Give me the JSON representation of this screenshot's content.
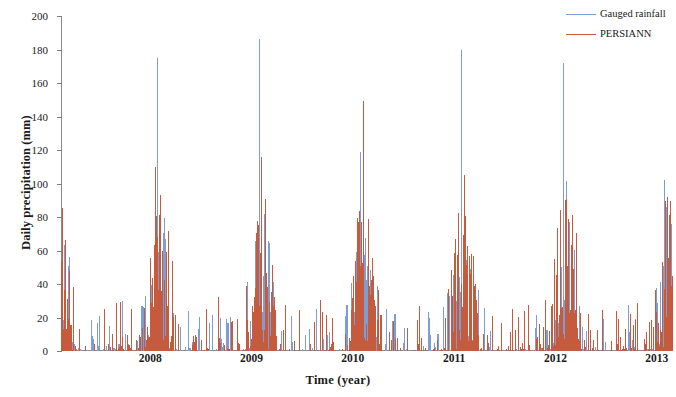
{
  "chart_data": {
    "type": "line",
    "title": "",
    "xlabel": "Time (year)",
    "ylabel": "Daily precipitation (mm)",
    "ylim": [
      0,
      200
    ],
    "yticks": [
      0,
      20,
      40,
      60,
      80,
      100,
      120,
      140,
      160,
      180,
      200
    ],
    "xticks": [
      "2008",
      "2009",
      "2010",
      "2011",
      "2012",
      "2013"
    ],
    "xlim": [
      "2007-08",
      "2013-08"
    ],
    "grid": false,
    "legend_position": "top-right",
    "series": [
      {
        "name": "Gauged rainfall",
        "color": "#7d9ed4",
        "peak_values_by_year": [
          175,
          186,
          119,
          180,
          172,
          102
        ],
        "notes": "Daily gauged station rainfall; strong monsoon peaks each summer, near-zero dry season."
      },
      {
        "name": "PERSIANN",
        "color": "#c65a3c",
        "peak_values_by_year": [
          93,
          116,
          149,
          105,
          90,
          92
        ],
        "notes": "PERSIANN satellite precipitation estimate; denser low-magnitude daily values, peak 149 mm in 2010."
      }
    ],
    "annotations": [
      {
        "label": "max gauged peak",
        "value": 186,
        "year": "2009"
      },
      {
        "label": "max PERSIANN peak",
        "value": 149,
        "year": "2010"
      }
    ]
  },
  "legend": {
    "items": [
      {
        "label": "Gauged rainfall",
        "color": "#7d9ed4"
      },
      {
        "label": "PERSIANN",
        "color": "#c65a3c"
      }
    ]
  },
  "axes": {
    "y_label": "Daily precipitation (mm)",
    "x_label": "Time (year)",
    "y_ticks": [
      "0",
      "20",
      "40",
      "60",
      "80",
      "100",
      "120",
      "140",
      "160",
      "180",
      "200"
    ],
    "x_ticks": [
      "2008",
      "2009",
      "2010",
      "2011",
      "2012",
      "2013"
    ]
  }
}
